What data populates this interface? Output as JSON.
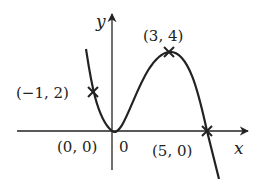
{
  "axes": {
    "x_label": "x",
    "y_label": "y",
    "origin_label": "0"
  },
  "points": [
    {
      "label": "(−1, 2)",
      "x": -1,
      "y": 2
    },
    {
      "label": "(0, 0)",
      "x": 0,
      "y": 0
    },
    {
      "label": "(3, 4)",
      "x": 3,
      "y": 4
    },
    {
      "label": "(5, 0)",
      "x": 5,
      "y": 0
    }
  ],
  "colors": {
    "stroke": "#222222",
    "background": "#ffffff"
  }
}
